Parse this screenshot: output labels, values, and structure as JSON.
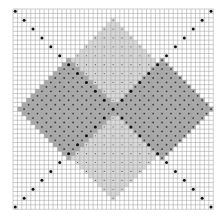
{
  "pattern": {
    "type": "knitting-chart",
    "grid": {
      "cols": 45,
      "rows": 45,
      "x": 13,
      "y": 9,
      "cell": 4.45
    },
    "colors": {
      "background": "#ffffff",
      "grid_line": "#9a9a9a",
      "light_fill": "#d9d9d9",
      "dark_fill": "#a8a8a8",
      "dot": "#111111",
      "light_dot": "#555555",
      "dark_dot": "#3a3a3a"
    },
    "regions": [
      {
        "name": "center-light-diamond",
        "cx": 22,
        "cy": 22,
        "r": 20,
        "fill": "light_fill",
        "dot": "light_dot",
        "dot_step": 2
      },
      {
        "name": "left-dark-diamond",
        "cx": 12,
        "cy": 22,
        "r": 11,
        "fill": "dark_fill",
        "dot": "dark_dot",
        "dot_step": 1
      },
      {
        "name": "right-dark-diamond",
        "cx": 33,
        "cy": 22,
        "r": 11,
        "fill": "dark_fill",
        "dot": "dark_dot",
        "dot_step": 1
      }
    ],
    "diagonals": {
      "step": 2,
      "color": "dot"
    }
  }
}
